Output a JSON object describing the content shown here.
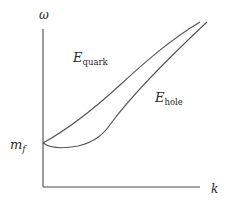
{
  "diagram": {
    "title": "",
    "axes": {
      "y_label": "ω",
      "x_label": "k"
    },
    "annotations": {
      "mass_label_main": "m",
      "mass_label_sub": "f",
      "quark_label_main": "E",
      "quark_label_sub": "quark",
      "hole_label_main": "E",
      "hole_label_sub": "hole"
    },
    "curves": [
      {
        "name": "E_quark",
        "description": "upper branch, starts at m_f and rises monotonically, approaching light-cone"
      },
      {
        "name": "E_hole",
        "description": "lower branch, starts at m_f, dips to a shallow minimum, then rises parallel to E_quark"
      }
    ],
    "colors": {
      "axis": "#4a4a4a",
      "curve": "#555555",
      "text": "#2a2a2a"
    }
  }
}
